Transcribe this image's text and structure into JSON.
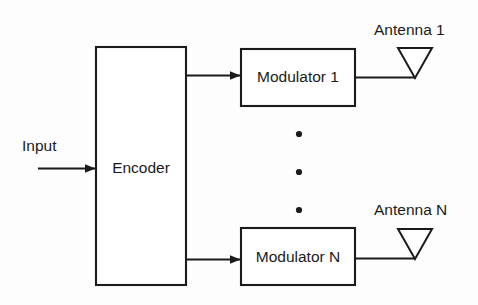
{
  "diagram": {
    "stroke_color": "#1b1b1b",
    "fill_color": "#ffffff",
    "background_color": "#fdfdfd",
    "blocks": [
      {
        "id": "encoder",
        "label": "Encoder"
      },
      {
        "id": "modulator_1",
        "label": "Modulator 1"
      },
      {
        "id": "modulator_n",
        "label": "Modulator N"
      }
    ],
    "labels": [
      {
        "id": "input",
        "label": "Input"
      },
      {
        "id": "antenna_1",
        "label": "Antenna 1"
      },
      {
        "id": "antenna_n",
        "label": "Antenna N"
      }
    ],
    "ellipsis": {
      "label": "vertical-ellipsis",
      "dot_count": 3
    },
    "connections": [
      {
        "from": "input",
        "to": "encoder",
        "arrow": true
      },
      {
        "from": "encoder",
        "to": "modulator_1",
        "arrow": true
      },
      {
        "from": "encoder",
        "to": "modulator_n",
        "arrow": true
      },
      {
        "from": "modulator_1",
        "to": "antenna_1",
        "arrow": false
      },
      {
        "from": "modulator_n",
        "to": "antenna_n",
        "arrow": false
      }
    ]
  }
}
